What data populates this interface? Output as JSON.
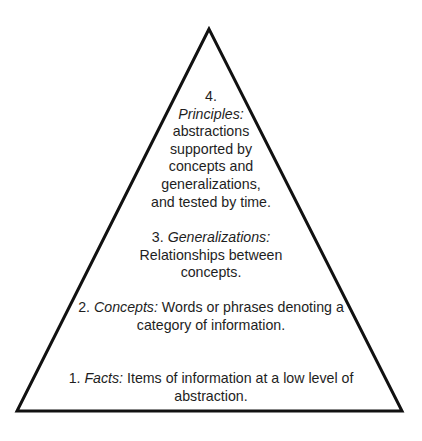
{
  "diagram": {
    "type": "pyramid",
    "shape": {
      "apex": [
        209,
        29
      ],
      "bottom_left": [
        17,
        411
      ],
      "bottom_right": [
        402,
        411
      ],
      "stroke_color": "#111111",
      "stroke_width": 3,
      "fill": "#ffffff"
    },
    "levels": [
      {
        "number": "4.",
        "term": "Principles:",
        "description": "abstractions supported by concepts and generalizations, and tested by time.",
        "lines": [
          "abstractions",
          "supported by",
          "concepts and",
          "generalizations,",
          "and tested by time."
        ]
      },
      {
        "number": "3.",
        "term": "Generalizations:",
        "description": "Relationships between concepts.",
        "lines": [
          "Relationships between",
          "concepts."
        ]
      },
      {
        "number": "2.",
        "term": "Concepts:",
        "description": "Words or phrases denoting a category of information.",
        "lines": [
          "Words or phrases denoting a",
          "category of information."
        ]
      },
      {
        "number": "1.",
        "term": "Facts:",
        "description": "Items of information at a low level of abstraction.",
        "lines": [
          "Items of information at a low level of",
          "abstraction."
        ]
      }
    ]
  }
}
